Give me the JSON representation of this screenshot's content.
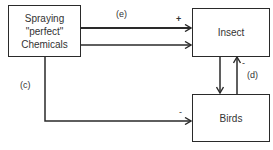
{
  "nodes": {
    "spraying": {
      "line1": "Spraying",
      "line2": "\"perfect\"",
      "line3": "Chemicals"
    },
    "insect": {
      "label": "Insect"
    },
    "birds": {
      "label": "Birds"
    }
  },
  "edges": {
    "spray_to_insect_upper": {
      "label": "(e)",
      "sign": "+"
    },
    "spray_to_insect_lower": {
      "label": "",
      "sign": ""
    },
    "spray_to_birds": {
      "label": "(c)",
      "sign": "-"
    },
    "insect_to_birds": {
      "label": "",
      "sign": ""
    },
    "birds_to_insect": {
      "label": "(d)",
      "sign": "-"
    }
  },
  "colors": {
    "line": "#2a2a2a",
    "text": "#333333",
    "background": "#ffffff"
  }
}
